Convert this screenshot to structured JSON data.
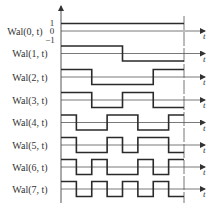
{
  "diagram": {
    "x_axis_label": "t",
    "y_ticks": [
      "1",
      "0",
      "−1"
    ],
    "colors": {
      "wave": "#2a2a2a",
      "axis": "#555555",
      "period_line": "#777777"
    },
    "segments_per_period": 8,
    "rows": [
      {
        "label": "Wal(0, t)",
        "name": "Wal",
        "index": "0",
        "arg": "t",
        "signs": [
          1,
          1,
          1,
          1,
          1,
          1,
          1,
          1
        ]
      },
      {
        "label": "Wal(1, t)",
        "name": "Wal",
        "index": "1",
        "arg": "t",
        "signs": [
          1,
          1,
          1,
          1,
          -1,
          -1,
          -1,
          -1
        ]
      },
      {
        "label": "Wal(2, t)",
        "name": "Wal",
        "index": "2",
        "arg": "t",
        "signs": [
          1,
          1,
          -1,
          -1,
          -1,
          -1,
          1,
          1
        ]
      },
      {
        "label": "Wal(3, t)",
        "name": "Wal",
        "index": "3",
        "arg": "t",
        "signs": [
          1,
          1,
          -1,
          -1,
          1,
          1,
          -1,
          -1
        ]
      },
      {
        "label": "Wal(4, t)",
        "name": "Wal",
        "index": "4",
        "arg": "t",
        "signs": [
          1,
          -1,
          -1,
          1,
          1,
          -1,
          -1,
          1
        ]
      },
      {
        "label": "Wal(5, t)",
        "name": "Wal",
        "index": "5",
        "arg": "t",
        "signs": [
          1,
          -1,
          -1,
          1,
          -1,
          1,
          1,
          -1
        ]
      },
      {
        "label": "Wal(6, t)",
        "name": "Wal",
        "index": "6",
        "arg": "t",
        "signs": [
          1,
          -1,
          1,
          -1,
          -1,
          1,
          -1,
          1
        ]
      },
      {
        "label": "Wal(7, t)",
        "name": "Wal",
        "index": "7",
        "arg": "t",
        "signs": [
          1,
          -1,
          1,
          -1,
          1,
          -1,
          1,
          -1
        ]
      }
    ]
  }
}
